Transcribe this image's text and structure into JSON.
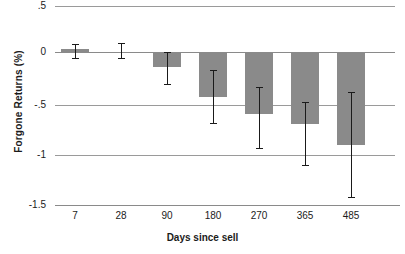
{
  "chart_data": {
    "type": "bar",
    "title": "",
    "xlabel": "Days since sell",
    "ylabel": "Forgone Returns (%)",
    "categories": [
      "7",
      "28",
      "90",
      "180",
      "270",
      "365",
      "485"
    ],
    "values": [
      0.07,
      0.04,
      -0.11,
      -0.41,
      -0.59,
      -0.69,
      -0.9
    ],
    "error_low": [
      -0.02,
      -0.02,
      -0.28,
      -0.68,
      -0.93,
      -1.1,
      -1.42
    ],
    "error_high": [
      0.12,
      0.13,
      0.04,
      -0.14,
      -0.31,
      -0.46,
      -0.36
    ],
    "ylim": [
      -1.5,
      0.5
    ],
    "yticks": [
      0.5,
      0,
      -0.5,
      -1,
      -1.5
    ],
    "ytick_labels": [
      ".5",
      "0",
      "-.5",
      "-1",
      "-1.5"
    ],
    "grid": true,
    "legend": "none",
    "bar_color": "#8a8a8a",
    "error_color": "#1a1a1a",
    "grid_color": "#9a9a9a"
  }
}
